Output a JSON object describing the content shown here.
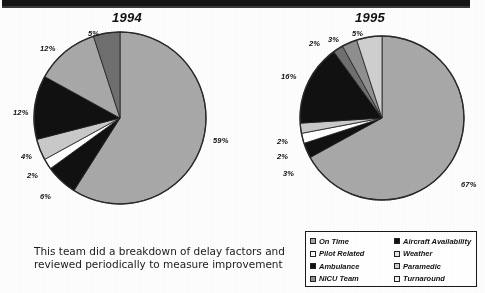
{
  "chart_data": [
    {
      "type": "pie",
      "title": "1994",
      "categories": [
        "On Time",
        "Aircraft Availability",
        "Pilot Related",
        "Weather",
        "Ambulance",
        "Paramedic",
        "NICU Team",
        "Turnaround"
      ],
      "labels": [
        "59%",
        "6%",
        "2%",
        "4%",
        "12%",
        "12%",
        "5%"
      ],
      "values": [
        59,
        6,
        2,
        4,
        12,
        12,
        5
      ],
      "slice_order_clockwise_from_top": [
        {
          "label": "59%",
          "value": 59,
          "fill": "#a8a8a8"
        },
        {
          "label": "6%",
          "value": 6,
          "fill": "#111111"
        },
        {
          "label": "2%",
          "value": 2,
          "fill": "#ffffff"
        },
        {
          "label": "4%",
          "value": 4,
          "fill": "#c9c9c9"
        },
        {
          "label": "12%",
          "value": 12,
          "fill": "#111111"
        },
        {
          "label": "12%",
          "value": 12,
          "fill": "#a8a8a8"
        },
        {
          "label": "5%",
          "value": 5,
          "fill": "#6f6f6f"
        }
      ],
      "legend_position": "bottom-right",
      "grid": false
    },
    {
      "type": "pie",
      "title": "1995",
      "categories": [
        "On Time",
        "Aircraft Availability",
        "Pilot Related",
        "Weather",
        "Ambulance",
        "Paramedic",
        "NICU Team",
        "Turnaround"
      ],
      "labels": [
        "67%",
        "3%",
        "2%",
        "2%",
        "16%",
        "2%",
        "3%",
        "5%"
      ],
      "values": [
        67,
        3,
        2,
        2,
        16,
        2,
        3,
        5
      ],
      "slice_order_clockwise_from_top": [
        {
          "label": "67%",
          "value": 67,
          "fill": "#a8a8a8"
        },
        {
          "label": "3%",
          "value": 3,
          "fill": "#111111"
        },
        {
          "label": "2%",
          "value": 2,
          "fill": "#ffffff"
        },
        {
          "label": "2%",
          "value": 2,
          "fill": "#c9c9c9"
        },
        {
          "label": "16%",
          "value": 16,
          "fill": "#111111"
        },
        {
          "label": "2%",
          "value": 2,
          "fill": "#6f6f6f"
        },
        {
          "label": "3%",
          "value": 3,
          "fill": "#8f8f8f"
        },
        {
          "label": "5%",
          "value": 5,
          "fill": "#cfcfcf"
        }
      ],
      "legend_position": "bottom-right",
      "grid": false
    }
  ],
  "charts": {
    "left": {
      "title": "1994",
      "pct": {
        "p59": "59%",
        "p6": "6%",
        "p2": "2%",
        "p4": "4%",
        "p12a": "12%",
        "p12b": "12%",
        "p5": "5%"
      }
    },
    "right": {
      "title": "1995",
      "pct": {
        "p67": "67%",
        "p3a": "3%",
        "p2a": "2%",
        "p2b": "2%",
        "p16": "16%",
        "p2c": "2%",
        "p3b": "3%",
        "p5": "5%"
      }
    }
  },
  "legend": {
    "items": [
      {
        "label": "On Time",
        "swatch": "#a8a8a8"
      },
      {
        "label": "Aircraft Availability",
        "swatch": "#111111"
      },
      {
        "label": "Pilot Related",
        "swatch": "#ffffff"
      },
      {
        "label": "Weather",
        "swatch": "#e6e6e6"
      },
      {
        "label": "Ambulance",
        "swatch": "#111111"
      },
      {
        "label": "Paramedic",
        "swatch": "#cfcfcf"
      },
      {
        "label": "NICU Team",
        "swatch": "#8f8f8f"
      },
      {
        "label": "Turnaround",
        "swatch": "#f2f2f2"
      }
    ]
  },
  "caption": {
    "line1": "This team did a breakdown of delay factors and",
    "line2": "reviewed periodically to measure improvement"
  },
  "colors": {
    "on_time_gray": "#a8a8a8",
    "black": "#111111",
    "white": "#ffffff",
    "mid_gray": "#8f8f8f",
    "dark_gray": "#6f6f6f",
    "light_gray": "#cfcfcf"
  }
}
